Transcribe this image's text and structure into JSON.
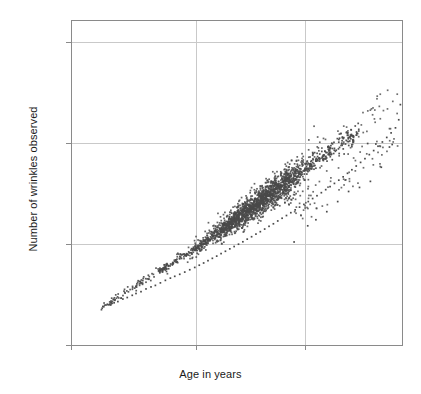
{
  "chart_data": {
    "type": "scatter",
    "title": "",
    "xlabel": "Age in years",
    "ylabel": "Number of wrinkles observed",
    "xlim": [
      20,
      78
    ],
    "ylim": [
      0,
      3200
    ],
    "xticks": [
      20,
      40,
      60
    ],
    "xtick_labels": [
      "20",
      "40",
      "60"
    ],
    "yticks": [
      0,
      1000,
      2000,
      3000
    ],
    "ytick_labels": [
      "0",
      "1,000",
      "2,000",
      "3,000"
    ],
    "grid": true,
    "grid_axes": "both",
    "grid_color": "#c9c9c9",
    "frame_color": "#8a8a8a",
    "marker_color": "#4a4a4a",
    "marker_size": 1.7,
    "marker_shape": "square",
    "legend": null,
    "n_points": 1600,
    "trend": {
      "type": "linear",
      "intercept": -600,
      "slope": 39,
      "note": "wrinkles = -600 + 39 * age (approximate central trend)"
    },
    "spread": {
      "sd_at_age_25": 18,
      "sd_at_age_45": 55,
      "sd_at_age_60": 95,
      "sd_at_age_75": 150
    },
    "outlier_cluster": {
      "x_range": [
        57,
        77
      ],
      "y_offset_range": [
        -520,
        -160
      ],
      "count": 70,
      "note": "Points falling below the main band at older ages"
    },
    "sample_points": [
      [
        25.1,
        382
      ],
      [
        25.6,
        396
      ],
      [
        26.2,
        405
      ],
      [
        26.9,
        418
      ],
      [
        27.5,
        430
      ],
      [
        28.3,
        455
      ],
      [
        29.0,
        470
      ],
      [
        29.8,
        492
      ],
      [
        30.4,
        510
      ],
      [
        31.2,
        528
      ],
      [
        32.0,
        555
      ],
      [
        32.8,
        575
      ],
      [
        33.5,
        590
      ],
      [
        34.3,
        615
      ],
      [
        35.1,
        640
      ],
      [
        35.9,
        662
      ],
      [
        36.6,
        680
      ],
      [
        37.4,
        700
      ],
      [
        38.2,
        722
      ],
      [
        39.0,
        745
      ],
      [
        39.8,
        768
      ],
      [
        40.6,
        790
      ],
      [
        41.4,
        812
      ],
      [
        42.2,
        835
      ],
      [
        43.0,
        858
      ],
      [
        43.8,
        880
      ],
      [
        44.6,
        905
      ],
      [
        45.4,
        928
      ],
      [
        46.2,
        952
      ],
      [
        47.0,
        975
      ],
      [
        47.8,
        998
      ],
      [
        48.6,
        1022
      ],
      [
        49.4,
        1048
      ],
      [
        50.2,
        1072
      ],
      [
        51.0,
        1098
      ],
      [
        51.8,
        1122
      ],
      [
        52.6,
        1148
      ],
      [
        53.4,
        1175
      ],
      [
        54.2,
        1200
      ],
      [
        55.0,
        1228
      ],
      [
        55.8,
        1255
      ],
      [
        56.6,
        1282
      ],
      [
        57.4,
        1310
      ],
      [
        58.2,
        1338
      ],
      [
        59.0,
        1365
      ],
      [
        59.8,
        1392
      ],
      [
        60.6,
        1420
      ],
      [
        61.4,
        1450
      ],
      [
        62.2,
        1478
      ],
      [
        63.0,
        1508
      ],
      [
        63.8,
        1538
      ],
      [
        64.6,
        1568
      ],
      [
        65.4,
        1600
      ],
      [
        66.2,
        1632
      ],
      [
        67.0,
        1665
      ],
      [
        67.8,
        1700
      ],
      [
        68.6,
        1735
      ],
      [
        69.4,
        1772
      ],
      [
        70.2,
        1808
      ],
      [
        71.0,
        1845
      ],
      [
        71.8,
        1885
      ],
      [
        72.6,
        1925
      ],
      [
        73.4,
        1968
      ],
      [
        74.2,
        2010
      ],
      [
        75.0,
        2055
      ],
      [
        75.8,
        2100
      ],
      [
        76.6,
        2150
      ],
      [
        77.2,
        2230
      ],
      [
        77.5,
        2380
      ],
      [
        58.0,
        1020
      ],
      [
        60.5,
        1180
      ],
      [
        62.0,
        1240
      ],
      [
        64.0,
        1320
      ],
      [
        66.0,
        1420
      ],
      [
        68.0,
        1520
      ],
      [
        70.0,
        1560
      ],
      [
        72.0,
        1620
      ],
      [
        74.0,
        1760
      ],
      [
        75.5,
        1960
      ],
      [
        76.0,
        1985
      ],
      [
        73.0,
        1990
      ],
      [
        71.5,
        1995
      ]
    ]
  }
}
